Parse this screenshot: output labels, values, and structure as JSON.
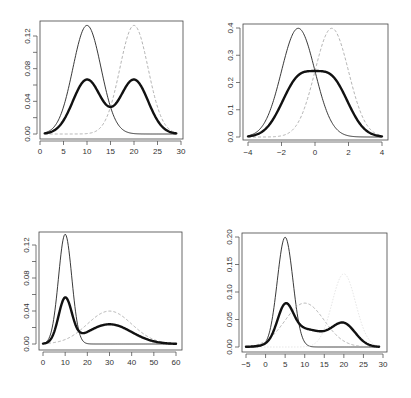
{
  "chart_data": [
    {
      "type": "line",
      "panel": "top-left",
      "title": "",
      "xlabel": "",
      "ylabel": "",
      "xlim": [
        0,
        30
      ],
      "ylim": [
        0,
        0.135
      ],
      "xticks": [
        0,
        5,
        10,
        15,
        20,
        25,
        30
      ],
      "yticks": [
        0.0,
        0.04,
        0.08,
        0.12
      ],
      "ytick_labels": [
        "0.00",
        "0.04",
        "0.08",
        "0.12"
      ],
      "minor_yticks": [
        0.02,
        0.06,
        0.1
      ],
      "x_range": [
        1,
        29
      ],
      "series": [
        {
          "name": "component 1",
          "style": "solid-thin",
          "dist": "normal",
          "mean": 10,
          "sd": 3,
          "weight": 1
        },
        {
          "name": "component 2",
          "style": "dashed-grey",
          "dist": "normal",
          "mean": 20,
          "sd": 3,
          "weight": 1
        },
        {
          "name": "mixture",
          "style": "solid-thick",
          "components": [
            {
              "mean": 10,
              "sd": 3,
              "weight": 0.5
            },
            {
              "mean": 20,
              "sd": 3,
              "weight": 0.5
            }
          ]
        }
      ],
      "frame": {
        "x0": 40,
        "x1": 183,
        "y0": 21,
        "y1": 139,
        "px_x0": 40,
        "px_x1": 181,
        "px_y0": 134,
        "px_y1": 36,
        "yv1": 0.12
      }
    },
    {
      "type": "line",
      "panel": "top-right",
      "title": "",
      "xlabel": "",
      "ylabel": "",
      "xlim": [
        -4,
        4
      ],
      "ylim": [
        0,
        0.4
      ],
      "xticks": [
        -4,
        -2,
        0,
        2,
        4
      ],
      "yticks": [
        0.0,
        0.1,
        0.2,
        0.3,
        0.4
      ],
      "ytick_labels": [
        "0.0",
        "0.1",
        "0.2",
        "0.3",
        "0.4"
      ],
      "minor_yticks": [],
      "x_range": [
        -4,
        4
      ],
      "series": [
        {
          "name": "component 1",
          "style": "solid-thin",
          "dist": "normal",
          "mean": -1,
          "sd": 1,
          "weight": 1
        },
        {
          "name": "component 2",
          "style": "dashed-grey",
          "dist": "normal",
          "mean": 1,
          "sd": 1,
          "weight": 1
        },
        {
          "name": "mixture",
          "style": "solid-thick",
          "components": [
            {
              "mean": -1,
              "sd": 1,
              "weight": 0.5
            },
            {
              "mean": 1,
              "sd": 1,
              "weight": 0.5
            }
          ]
        }
      ],
      "frame": {
        "x0": 243,
        "x1": 388,
        "y0": 24,
        "y1": 140,
        "px_x0": 248,
        "px_x1": 382,
        "px_y0": 137,
        "px_y1": 28,
        "yv1": 0.4
      }
    },
    {
      "type": "line",
      "panel": "bottom-left",
      "title": "",
      "xlabel": "",
      "ylabel": "",
      "xlim": [
        0,
        60
      ],
      "ylim": [
        0,
        0.135
      ],
      "xticks": [
        0,
        10,
        20,
        30,
        40,
        50,
        60
      ],
      "yticks": [
        0.0,
        0.04,
        0.08,
        0.12
      ],
      "ytick_labels": [
        "0.00",
        "0.04",
        "0.08",
        "0.12"
      ],
      "minor_yticks": [
        0.02,
        0.06,
        0.1
      ],
      "x_range": [
        0,
        60
      ],
      "series": [
        {
          "name": "component 1",
          "style": "solid-thin",
          "dist": "normal",
          "mean": 10,
          "sd": 3,
          "weight": 1
        },
        {
          "name": "component 2",
          "style": "dashed-grey",
          "dist": "normal",
          "mean": 30,
          "sd": 10,
          "weight": 1
        },
        {
          "name": "mixture",
          "style": "solid-thick",
          "components": [
            {
              "mean": 10,
              "sd": 3,
              "weight": 0.4
            },
            {
              "mean": 30,
              "sd": 10,
              "weight": 0.6
            }
          ]
        }
      ],
      "frame": {
        "x0": 39,
        "x1": 182,
        "y0": 232,
        "y1": 350,
        "px_x0": 43,
        "px_x1": 176,
        "px_y0": 344,
        "px_y1": 245,
        "yv1": 0.12
      }
    },
    {
      "type": "line",
      "panel": "bottom-right",
      "title": "",
      "xlabel": "",
      "ylabel": "",
      "xlim": [
        -5,
        30
      ],
      "ylim": [
        0,
        0.2
      ],
      "xticks": [
        -5,
        0,
        5,
        10,
        15,
        20,
        25,
        30
      ],
      "yticks": [
        0.0,
        0.05,
        0.1,
        0.15,
        0.2
      ],
      "ytick_labels": [
        "0.00",
        "0.05",
        "0.10",
        "0.15",
        "0.20"
      ],
      "minor_yticks": [],
      "x_range": [
        -5,
        29
      ],
      "series": [
        {
          "name": "component 1",
          "style": "solid-thin",
          "dist": "normal",
          "mean": 5,
          "sd": 2,
          "weight": 1
        },
        {
          "name": "component 2",
          "style": "dashed-grey",
          "dist": "normal",
          "mean": 10,
          "sd": 5,
          "weight": 1
        },
        {
          "name": "component 3",
          "style": "dotted-faint",
          "dist": "normal",
          "mean": 20,
          "sd": 3,
          "weight": 1
        },
        {
          "name": "mixture",
          "style": "solid-thick",
          "components": [
            {
              "mean": 5,
              "sd": 2,
              "weight": 0.3
            },
            {
              "mean": 10,
              "sd": 5,
              "weight": 0.4
            },
            {
              "mean": 20,
              "sd": 3,
              "weight": 0.3
            }
          ]
        }
      ],
      "frame": {
        "x0": 242,
        "x1": 387,
        "y0": 233,
        "y1": 352,
        "px_x0": 246,
        "px_x1": 383,
        "px_y0": 347,
        "px_y1": 237,
        "yv1": 0.2
      }
    }
  ]
}
